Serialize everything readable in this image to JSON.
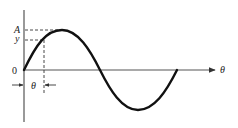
{
  "diagram": {
    "type": "sine-wave",
    "labels": {
      "amplitude": "A",
      "value": "y",
      "origin": "0",
      "x_axis": "θ",
      "angle_marker": "θ"
    },
    "colors": {
      "stroke": "#111111",
      "axis": "#555555",
      "dash": "#333333"
    }
  }
}
